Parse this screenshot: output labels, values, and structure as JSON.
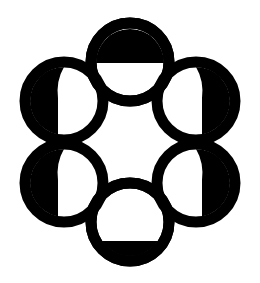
{
  "image": {
    "title": "Six-circle rosette glyph",
    "alt_text": "Black outlined rosette of six overlapping rings arranged in a hexagon, each ring partly filled solid black",
    "background_color": "#ffffff",
    "ink_color": "#000000",
    "canvas": {
      "width": 260,
      "height": 283
    }
  },
  "geometry": {
    "ring_outer_radius": 45,
    "ring_stroke_width": 11,
    "centers": [
      {
        "name": "top",
        "cx": 130,
        "cy": 62
      },
      {
        "name": "upper-right",
        "cx": 196,
        "cy": 101
      },
      {
        "name": "lower-right",
        "cx": 196,
        "cy": 183
      },
      {
        "name": "bottom",
        "cx": 130,
        "cy": 222
      },
      {
        "name": "lower-left",
        "cx": 64,
        "cy": 183
      },
      {
        "name": "upper-left",
        "cx": 64,
        "cy": 101
      }
    ]
  },
  "petals": [
    {
      "id": "petal-top",
      "label": "Top ring",
      "position": "top",
      "fill_style": "upper-half-dome",
      "fill_color": "#000000",
      "cx": 130,
      "cy": 62,
      "radius": 39
    },
    {
      "id": "petal-upper-right",
      "label": "Upper right ring",
      "position": "upper-right",
      "fill_style": "right-crescent",
      "fill_color": "#000000",
      "cx": 196,
      "cy": 101,
      "radius": 39
    },
    {
      "id": "petal-lower-right",
      "label": "Lower right ring",
      "position": "lower-right",
      "fill_style": "right-crescent",
      "fill_color": "#000000",
      "cx": 196,
      "cy": 183,
      "radius": 39
    },
    {
      "id": "petal-bottom",
      "label": "Bottom ring",
      "position": "bottom",
      "fill_style": "lower-segment",
      "fill_color": "#000000",
      "cx": 130,
      "cy": 222,
      "radius": 39
    },
    {
      "id": "petal-lower-left",
      "label": "Lower left ring",
      "position": "lower-left",
      "fill_style": "left-crescent",
      "fill_color": "#000000",
      "cx": 64,
      "cy": 183,
      "radius": 39
    },
    {
      "id": "petal-upper-left",
      "label": "Upper left ring",
      "position": "upper-left",
      "fill_style": "left-crescent",
      "fill_color": "#000000",
      "cx": 64,
      "cy": 101,
      "radius": 39
    }
  ]
}
